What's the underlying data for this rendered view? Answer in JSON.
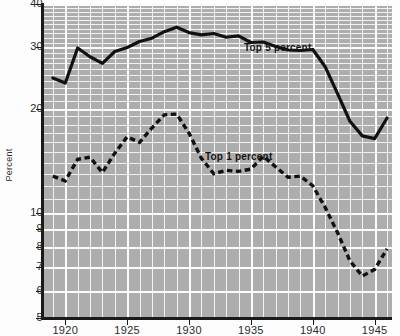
{
  "chart_data": {
    "type": "line",
    "title": "",
    "xlabel": "",
    "ylabel": "Percent",
    "y_scale": "log",
    "ylim": [
      5,
      40
    ],
    "xlim": [
      1918.2,
      1946.4
    ],
    "grid": true,
    "legend_position": "inline-annotation",
    "y_ticks": [
      40,
      30,
      20,
      10,
      9,
      8,
      7,
      6,
      5
    ],
    "y_tick_labels": [
      "40",
      "30",
      "20",
      "10",
      "9",
      "8",
      "7",
      "6",
      "5"
    ],
    "x_ticks": [
      1920,
      1925,
      1930,
      1935,
      1940,
      1945
    ],
    "x_tick_labels": [
      "1920",
      "1925",
      "1930",
      "1935",
      "1940",
      "1945"
    ],
    "series": [
      {
        "name": "Top 5 percent",
        "style": "solid",
        "color": "#111111",
        "x": [
          1919,
          1920,
          1921,
          1922,
          1923,
          1924,
          1925,
          1926,
          1927,
          1928,
          1929,
          1930,
          1931,
          1932,
          1933,
          1934,
          1935,
          1936,
          1937,
          1938,
          1939,
          1940,
          1941,
          1942,
          1943,
          1944,
          1945,
          1946
        ],
        "values": [
          24.5,
          23.7,
          29.9,
          28.2,
          27.0,
          29.2,
          30.0,
          31.2,
          31.9,
          33.3,
          34.3,
          33.1,
          32.6,
          32.9,
          32.1,
          32.4,
          31.0,
          31.1,
          30.2,
          29.5,
          29.4,
          29.6,
          26.4,
          22.1,
          18.4,
          16.7,
          16.4,
          18.8
        ]
      },
      {
        "name": "Top 1 percent",
        "style": "dashed",
        "color": "#111111",
        "x": [
          1919,
          1920,
          1921,
          1922,
          1923,
          1924,
          1925,
          1926,
          1927,
          1928,
          1929,
          1930,
          1931,
          1932,
          1933,
          1934,
          1935,
          1936,
          1937,
          1938,
          1939,
          1940,
          1941,
          1942,
          1943,
          1944,
          1945,
          1946
        ],
        "values": [
          12.8,
          12.4,
          14.3,
          14.5,
          13.1,
          14.9,
          16.6,
          16.0,
          17.6,
          19.2,
          19.3,
          17.0,
          14.4,
          13.0,
          13.3,
          13.2,
          13.4,
          14.6,
          13.6,
          12.7,
          12.8,
          12.0,
          10.4,
          8.8,
          7.3,
          6.6,
          6.9,
          7.9
        ]
      }
    ],
    "annotations": [
      {
        "text": "Top 5 percent",
        "series": "Top 5 percent"
      },
      {
        "text": "Top 1 percent",
        "series": "Top 1 percent"
      }
    ]
  },
  "axis": {
    "y_label": "Percent",
    "y_ticks": [
      {
        "label": "40"
      },
      {
        "label": "30"
      },
      {
        "label": "20"
      },
      {
        "label": "10"
      },
      {
        "label": "9"
      },
      {
        "label": "8"
      },
      {
        "label": "7"
      },
      {
        "label": "6"
      },
      {
        "label": "5"
      }
    ],
    "x_ticks": [
      {
        "label": "1920"
      },
      {
        "label": "1925"
      },
      {
        "label": "1930"
      },
      {
        "label": "1935"
      },
      {
        "label": "1940"
      },
      {
        "label": "1945"
      }
    ]
  },
  "colors": {
    "plot_background": "#adadad",
    "gridline": "#f2f2f2",
    "line": "#111111",
    "axis": "#1a1a1a",
    "page_background": "#fdfdfd"
  }
}
